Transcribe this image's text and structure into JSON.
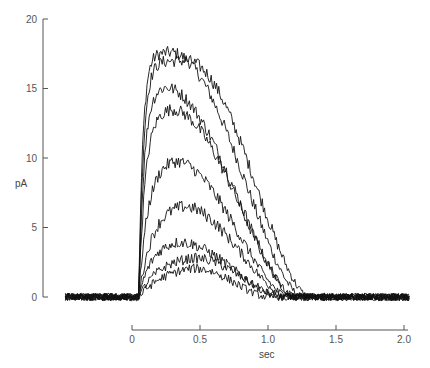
{
  "chart_data": {
    "type": "line",
    "title": "",
    "xlabel": "sec",
    "ylabel": "pA",
    "xlim": [
      -0.5,
      2.05
    ],
    "ylim": [
      0,
      20
    ],
    "x_ticks": [
      0,
      0.5,
      1.0,
      1.5,
      2.0
    ],
    "x_tick_labels": [
      "0",
      "0.5",
      "1.0",
      "1.5",
      "2.0"
    ],
    "y_ticks": [
      0,
      5,
      10,
      15,
      20
    ],
    "y_tick_labels": [
      "0",
      "5",
      "10",
      "15",
      "20"
    ],
    "grid": false,
    "legend": "none",
    "trace_start_sec": -0.49,
    "trace_end_sec": 2.04,
    "onset_sec": 0.05,
    "noise_pA": 0.45,
    "series": [
      {
        "name": "trace-1",
        "peak_pA": 17.6,
        "peak_time_sec": 0.28,
        "rise_tau": 0.03,
        "decay_end_sec": 1.25
      },
      {
        "name": "trace-2",
        "peak_pA": 17.0,
        "peak_time_sec": 0.4,
        "rise_tau": 0.035,
        "decay_end_sec": 1.3
      },
      {
        "name": "trace-3",
        "peak_pA": 15.2,
        "peak_time_sec": 0.22,
        "rise_tau": 0.04,
        "decay_end_sec": 1.2
      },
      {
        "name": "trace-4",
        "peak_pA": 13.6,
        "peak_time_sec": 0.27,
        "rise_tau": 0.05,
        "decay_end_sec": 1.2
      },
      {
        "name": "trace-5",
        "peak_pA": 10.0,
        "peak_time_sec": 0.28,
        "rise_tau": 0.07,
        "decay_end_sec": 1.15
      },
      {
        "name": "trace-6",
        "peak_pA": 6.8,
        "peak_time_sec": 0.33,
        "rise_tau": 0.1,
        "decay_end_sec": 1.15
      },
      {
        "name": "trace-7",
        "peak_pA": 4.2,
        "peak_time_sec": 0.28,
        "rise_tau": 0.1,
        "decay_end_sec": 1.1
      },
      {
        "name": "trace-8",
        "peak_pA": 3.0,
        "peak_time_sec": 0.42,
        "rise_tau": 0.15,
        "decay_end_sec": 1.1
      },
      {
        "name": "trace-9",
        "peak_pA": 2.4,
        "peak_time_sec": 0.4,
        "rise_tau": 0.2,
        "decay_end_sec": 1.0
      }
    ]
  }
}
